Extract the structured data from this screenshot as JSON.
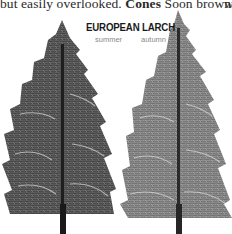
{
  "page": {
    "body_text": {
      "pre": "but easily overlooked. ",
      "bold": "Cones",
      "post": " Soon brown; oval,",
      "next_column_fragment": "w"
    },
    "figure": {
      "title": "EUROPEAN LARCH",
      "panels": [
        {
          "label": "summer",
          "tone": "#4a4a4a"
        },
        {
          "label": "autumn",
          "tone": "#7a7a7a"
        }
      ]
    }
  }
}
